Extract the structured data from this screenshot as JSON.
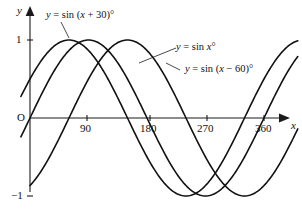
{
  "figure": {
    "background": "#ffffff",
    "ink_color": "#111111"
  },
  "axes": {
    "y_axis_label": "y",
    "x_axis_label": "x",
    "origin_label": "O",
    "y_ticks": [
      {
        "label": "1",
        "value": 1
      },
      {
        "label": "−1",
        "value": -1
      }
    ],
    "x_ticks": [
      {
        "label": "90",
        "value": 90
      },
      {
        "label": "180",
        "value": 180
      },
      {
        "label": "270",
        "value": 270
      },
      {
        "label": "360",
        "value": 360
      }
    ]
  },
  "annotations": [
    {
      "id": "curve-label-plus30",
      "prefix": "y",
      "equals": "=",
      "func": "sin",
      "expr_open": "(",
      "variable": "x",
      "operator": "+",
      "offset": "30",
      "expr_close": ")",
      "degree": "°",
      "text": "y = sin (x + 30)°"
    },
    {
      "id": "curve-label-x",
      "prefix": "y",
      "equals": "=",
      "func": "sin",
      "variable": "x",
      "degree": "°",
      "text": "y = sin x°"
    },
    {
      "id": "curve-label-minus60",
      "prefix": "y",
      "equals": "=",
      "func": "sin",
      "expr_open": "(",
      "variable": "x",
      "operator": "−",
      "offset": "60",
      "expr_close": ")",
      "degree": "°",
      "text": "y = sin (x − 60)°"
    }
  ],
  "chart_data": {
    "type": "line",
    "title": "",
    "xlabel": "x",
    "ylabel": "y",
    "xlim": [
      -12,
      430
    ],
    "ylim": [
      -1.25,
      1.25
    ],
    "grid": false,
    "legend": "inline-annotations",
    "x_unit": "degrees",
    "x_tick_values": [
      90,
      180,
      270,
      360
    ],
    "y_tick_values": [
      1,
      -1
    ],
    "series": [
      {
        "name": "y = sin (x + 30)°",
        "amplitude": 1,
        "period": 360,
        "phase_shift_deg": -30,
        "y_at_x0": 0.5,
        "max_at_x": 60,
        "min_at_x": 240,
        "zeros": [
          -30,
          150,
          330
        ],
        "points": [
          {
            "x": -12,
            "y": 0.309
          },
          {
            "x": 0,
            "y": 0.5
          },
          {
            "x": 30,
            "y": 0.866
          },
          {
            "x": 60,
            "y": 1
          },
          {
            "x": 90,
            "y": 0.866
          },
          {
            "x": 120,
            "y": 0.5
          },
          {
            "x": 150,
            "y": 0
          },
          {
            "x": 180,
            "y": -0.5
          },
          {
            "x": 210,
            "y": -0.866
          },
          {
            "x": 240,
            "y": -1
          },
          {
            "x": 270,
            "y": -0.866
          },
          {
            "x": 300,
            "y": -0.5
          },
          {
            "x": 330,
            "y": 0
          },
          {
            "x": 360,
            "y": 0.5
          },
          {
            "x": 390,
            "y": 0.866
          },
          {
            "x": 420,
            "y": 1
          }
        ]
      },
      {
        "name": "y = sin x°",
        "amplitude": 1,
        "period": 360,
        "phase_shift_deg": 0,
        "y_at_x0": 0,
        "max_at_x": 90,
        "min_at_x": 270,
        "zeros": [
          0,
          180,
          360
        ],
        "points": [
          {
            "x": 0,
            "y": 0
          },
          {
            "x": 30,
            "y": 0.5
          },
          {
            "x": 60,
            "y": 0.866
          },
          {
            "x": 90,
            "y": 1
          },
          {
            "x": 120,
            "y": 0.866
          },
          {
            "x": 150,
            "y": 0.5
          },
          {
            "x": 180,
            "y": 0
          },
          {
            "x": 210,
            "y": -0.5
          },
          {
            "x": 240,
            "y": -0.866
          },
          {
            "x": 270,
            "y": -1
          },
          {
            "x": 300,
            "y": -0.866
          },
          {
            "x": 330,
            "y": -0.5
          },
          {
            "x": 360,
            "y": 0
          },
          {
            "x": 390,
            "y": 0.5
          },
          {
            "x": 420,
            "y": 0.866
          }
        ]
      },
      {
        "name": "y = sin (x − 60)°",
        "amplitude": 1,
        "period": 360,
        "phase_shift_deg": 60,
        "y_at_x0": -0.866,
        "max_at_x": 150,
        "min_at_x": 330,
        "zeros": [
          60,
          240,
          420
        ],
        "points": [
          {
            "x": 0,
            "y": -0.866
          },
          {
            "x": 30,
            "y": -0.5
          },
          {
            "x": 60,
            "y": 0
          },
          {
            "x": 90,
            "y": 0.5
          },
          {
            "x": 120,
            "y": 0.866
          },
          {
            "x": 150,
            "y": 1
          },
          {
            "x": 180,
            "y": 0.866
          },
          {
            "x": 210,
            "y": 0.5
          },
          {
            "x": 240,
            "y": 0
          },
          {
            "x": 270,
            "y": -0.5
          },
          {
            "x": 300,
            "y": -0.866
          },
          {
            "x": 330,
            "y": -1
          },
          {
            "x": 360,
            "y": -0.866
          },
          {
            "x": 390,
            "y": -0.5
          },
          {
            "x": 420,
            "y": 0
          }
        ]
      }
    ]
  }
}
